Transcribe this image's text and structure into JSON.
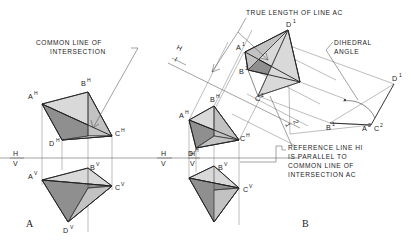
{
  "figure": {
    "title_implicit": "Descriptive geometry: dihedral angle between two planes",
    "panels": [
      {
        "key": "A",
        "label": "A"
      },
      {
        "key": "B",
        "label": "B"
      }
    ]
  },
  "notes": {
    "common_line": [
      "COMMON LINE OF",
      "INTERSECTION"
    ],
    "true_length": "TRUE LENGTH OF LINE AC",
    "dihedral": [
      "DIHEDRAL",
      "ANGLE"
    ],
    "reference_note": [
      "REFERENCE LINE HI",
      "IS PARALLEL TO",
      "COMMON LINE OF",
      "INTERSECTION AC"
    ]
  },
  "reference_lines": {
    "hv_left_label": {
      "top": "H",
      "bottom": "V"
    },
    "hv_mid_label": {
      "top": "H",
      "bottom": "V"
    },
    "hv_right_label": {
      "top": "H",
      "bottom": "V"
    },
    "hi_label": {
      "top": "H",
      "bottom": "I"
    },
    "one_two_label": {
      "top": "1",
      "bottom": "2"
    }
  },
  "panel_a": {
    "horizontal_view": [
      {
        "id": "A",
        "sup": "H",
        "x": 34,
        "y": 102
      },
      {
        "id": "B",
        "sup": "H",
        "x": 84,
        "y": 88
      },
      {
        "id": "C",
        "sup": "H",
        "x": 115,
        "y": 132
      },
      {
        "id": "D",
        "sup": "H",
        "x": 52,
        "y": 142
      }
    ],
    "vertical_view": [
      {
        "id": "A",
        "sup": "V",
        "x": 34,
        "y": 178
      },
      {
        "id": "B",
        "sup": "V",
        "x": 84,
        "y": 162
      },
      {
        "id": "C",
        "sup": "V",
        "x": 115,
        "y": 186
      },
      {
        "id": "D",
        "sup": "V",
        "x": 62,
        "y": 224
      }
    ]
  },
  "panel_b": {
    "horizontal_view": [
      {
        "id": "A",
        "sup": "H"
      },
      {
        "id": "B",
        "sup": "H"
      },
      {
        "id": "C",
        "sup": "H"
      },
      {
        "id": "D",
        "sup": "H"
      }
    ],
    "vertical_view": [
      {
        "id": "B",
        "sup": "V"
      },
      {
        "id": "C",
        "sup": "V"
      }
    ],
    "aux_view_1": [
      {
        "id": "A",
        "sup": "1"
      },
      {
        "id": "B",
        "sup": "1"
      },
      {
        "id": "C",
        "sup": "1"
      },
      {
        "id": "D",
        "sup": "1"
      }
    ],
    "aux_view_2": [
      {
        "id": "D",
        "sup": "1"
      },
      {
        "id": "B",
        "sup": "1"
      },
      {
        "id": "A",
        "sup": "2"
      },
      {
        "id": "C",
        "sup": "2"
      }
    ]
  },
  "colors": {
    "ink": "#1c1c1c",
    "line": "#3a3a3a",
    "fill_light": "#d9d9d9",
    "fill_mid": "#c2c2c2",
    "fill_dark": "#8f8f8f",
    "background": "#ffffff"
  }
}
